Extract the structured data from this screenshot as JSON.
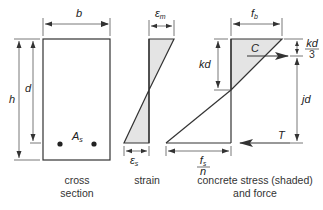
{
  "diagram": {
    "colors": {
      "line": "#333333",
      "shade": "#e4e4e4",
      "background": "#ffffff"
    },
    "cross_section": {
      "width_label": "b",
      "height_label": "h",
      "depth_label": "d",
      "steel_label": "A",
      "steel_sub": "s",
      "caption_line1": "cross",
      "caption_line2": "section"
    },
    "strain": {
      "top_label": "ε",
      "top_sub": "m",
      "bottom_label": "ε",
      "bottom_sub": "s",
      "caption": "strain"
    },
    "stress": {
      "top_label": "f",
      "top_sub": "b",
      "kd_label": "kd",
      "kd3_num": "kd",
      "kd3_den": "3",
      "compression_label": "C",
      "lever_arm_label": "jd",
      "tension_label": "T",
      "bottom_num": "f",
      "bottom_num_sub": "s",
      "bottom_den": "n",
      "caption_line1": "concrete stress (shaded)",
      "caption_line2": "and force"
    }
  }
}
